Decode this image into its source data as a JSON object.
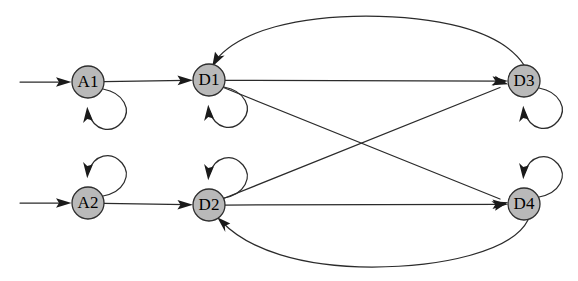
{
  "diagram": {
    "type": "state-transition-graph",
    "title": "",
    "background_color": "#ffffff",
    "node_fill_color": "#b9b9b9",
    "node_stroke_color": "#2e2e2e",
    "edge_color": "#2b2b2b",
    "label_color": "#000000",
    "node_radius": 16,
    "nodes": [
      {
        "id": "A1",
        "label": "A1",
        "cx": 88,
        "cy": 82,
        "row": "top"
      },
      {
        "id": "D1",
        "label": "D1",
        "cx": 209,
        "cy": 80,
        "row": "top"
      },
      {
        "id": "D3",
        "label": "D3",
        "cx": 524,
        "cy": 81,
        "row": "top"
      },
      {
        "id": "A2",
        "label": "A2",
        "cx": 88,
        "cy": 203,
        "row": "bottom"
      },
      {
        "id": "D2",
        "label": "D2",
        "cx": 209,
        "cy": 205,
        "row": "bottom"
      },
      {
        "id": "D4",
        "label": "D4",
        "cx": 524,
        "cy": 204,
        "row": "bottom"
      }
    ],
    "entry_arrows": [
      {
        "id": "entry-a1",
        "target": "A1",
        "from_x": 20,
        "y": 82
      },
      {
        "id": "entry-a2",
        "target": "A2",
        "from_x": 20,
        "y": 203
      }
    ],
    "edges": [
      {
        "id": "a1-d1",
        "from": "A1",
        "to": "D1",
        "shape": "straight"
      },
      {
        "id": "d1-d3",
        "from": "D1",
        "to": "D3",
        "shape": "straight"
      },
      {
        "id": "a2-d2",
        "from": "A2",
        "to": "D2",
        "shape": "straight"
      },
      {
        "id": "d2-d4",
        "from": "D2",
        "to": "D4",
        "shape": "straight"
      },
      {
        "id": "d1-d4",
        "from": "D1",
        "to": "D4",
        "shape": "diagonal"
      },
      {
        "id": "d2-d3",
        "from": "D2",
        "to": "D3",
        "shape": "diagonal"
      },
      {
        "id": "d3-d1",
        "from": "D3",
        "to": "D1",
        "shape": "curve-over-top"
      },
      {
        "id": "d4-d2",
        "from": "D4",
        "to": "D2",
        "shape": "curve-under-bottom"
      }
    ],
    "self_loops": [
      {
        "id": "loop-a1",
        "node": "A1",
        "position": "below-right"
      },
      {
        "id": "loop-d1",
        "node": "D1",
        "position": "below-right"
      },
      {
        "id": "loop-d3",
        "node": "D3",
        "position": "below-right"
      },
      {
        "id": "loop-a2",
        "node": "A2",
        "position": "above-right"
      },
      {
        "id": "loop-d2",
        "node": "D2",
        "position": "above-right"
      },
      {
        "id": "loop-d4",
        "node": "D4",
        "position": "above-right"
      }
    ]
  }
}
